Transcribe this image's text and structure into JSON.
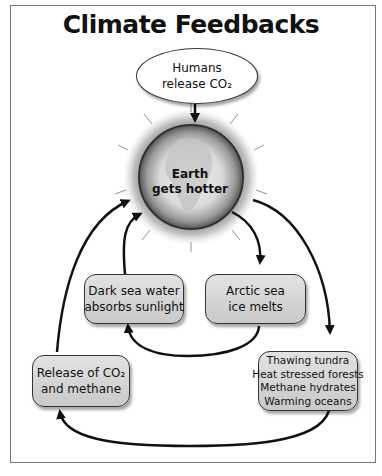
{
  "diagram": {
    "title": "Climate Feedbacks",
    "credit": "ILLUSTRATION: KEITH PAVLIK",
    "nodes": {
      "humans": {
        "lines": [
          "Humans",
          "release CO₂"
        ],
        "shape": "ellipse"
      },
      "earth": {
        "lines": [
          "Earth",
          "gets hotter"
        ],
        "shape": "globe"
      },
      "dark_sea": {
        "lines": [
          "Dark sea water",
          "absorbs sunlight"
        ],
        "shape": "rounded-box"
      },
      "arctic": {
        "lines": [
          "Arctic sea",
          "ice melts"
        ],
        "shape": "rounded-box"
      },
      "release": {
        "lines": [
          "Release of CO₂",
          "and methane"
        ],
        "shape": "rounded-box"
      },
      "thawing": {
        "lines": [
          "Thawing tundra",
          "Heat stressed forests",
          "Methane hydrates",
          "Warming oceans"
        ],
        "shape": "rounded-box"
      }
    },
    "edges": [
      {
        "from": "Humans release CO2",
        "to": "Earth gets hotter"
      },
      {
        "from": "Earth gets hotter",
        "to": "Arctic sea ice melts"
      },
      {
        "from": "Arctic sea ice melts",
        "to": "Dark sea water absorbs sunlight"
      },
      {
        "from": "Dark sea water absorbs sunlight",
        "to": "Earth gets hotter"
      },
      {
        "from": "Earth gets hotter",
        "to": "Thawing tundra / Heat stressed forests / Methane hydrates / Warming oceans"
      },
      {
        "from": "Thawing tundra / Heat stressed forests / Methane hydrates / Warming oceans",
        "to": "Release of CO2 and methane"
      },
      {
        "from": "Release of CO2 and methane",
        "to": "Earth gets hotter"
      }
    ],
    "colors": {
      "box_fill": "#d4d4d4",
      "stroke": "#111111",
      "ellipse_fill": "#ffffff"
    }
  }
}
